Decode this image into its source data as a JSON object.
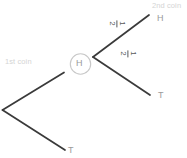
{
  "diagram": {
    "type": "probability-tree",
    "background_color": "#ffffff",
    "stage_labels": {
      "first": "1st coin",
      "second": "2nd coin",
      "color": "#d4d4d4"
    },
    "nodes": {
      "root": {
        "label": "",
        "x": 2,
        "y": 110
      },
      "heads_node": {
        "label": "H",
        "x": 80,
        "y": 64,
        "circled": true,
        "circle_color": "#c8c8c8",
        "text_color": "#9a9a9a"
      }
    },
    "branches": [
      {
        "name": "first-coin-heads",
        "from": "root",
        "to": "heads_node",
        "probability": "",
        "color": "#3a3a3a"
      },
      {
        "name": "first-coin-tails",
        "from": "root",
        "to": "tails-leaf",
        "probability": "",
        "color": "#3a3a3a"
      },
      {
        "name": "second-coin-heads",
        "from": "heads_node",
        "to": "hh-leaf",
        "probability": "1/2",
        "numerator": "1",
        "denominator": "2",
        "color": "#3a3a3a"
      },
      {
        "name": "second-coin-tails",
        "from": "heads_node",
        "to": "ht-leaf",
        "probability": "1/2",
        "numerator": "1",
        "denominator": "2",
        "color": "#3a3a3a"
      }
    ],
    "leaves": [
      {
        "name": "hh-leaf",
        "label": "H",
        "x": 157,
        "y": 18
      },
      {
        "name": "ht-leaf",
        "label": "T",
        "x": 158,
        "y": 95
      },
      {
        "name": "t-leaf",
        "label": "T",
        "x": 68,
        "y": 150
      }
    ]
  }
}
